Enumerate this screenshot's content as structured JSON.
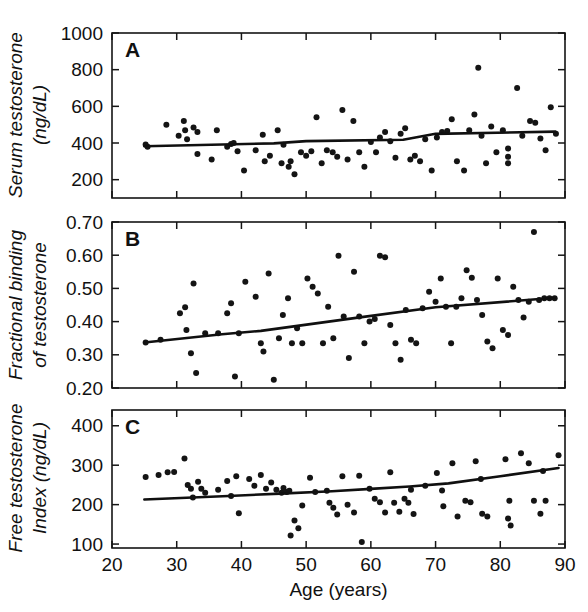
{
  "figure": {
    "background": "#ffffff",
    "ink_color": "#141414",
    "point_color": "#141414",
    "line_color": "#101010"
  },
  "chart_data": [
    {
      "type": "scatter",
      "panel": "A",
      "title": "",
      "xlabel": "Age (years)",
      "ylabel": "Serum testosterone (ng/dL)",
      "ylabel_line1": "Serum testosterone",
      "ylabel_line2": "(ng/dL)",
      "xlim": [
        20,
        90
      ],
      "ylim": [
        100,
        1000
      ],
      "xticks": [
        20,
        30,
        40,
        50,
        60,
        70,
        80,
        90
      ],
      "xticklabels": [
        "20",
        "30",
        "40",
        "50",
        "60",
        "70",
        "80",
        "90"
      ],
      "yticks": [
        200,
        400,
        600,
        800,
        1000
      ],
      "yticklabels": [
        "200",
        "400",
        "600",
        "800",
        "1000"
      ],
      "grid": false,
      "legend": "none",
      "x": [
        25.2,
        25.5,
        28.4,
        30.3,
        31.1,
        31.3,
        31.6,
        32.6,
        33.2,
        33.2,
        35.4,
        36.2,
        37.8,
        38.4,
        38.8,
        39.4,
        40.4,
        42.2,
        43.3,
        43.6,
        44.4,
        45.6,
        46.2,
        46.5,
        47.3,
        47.6,
        48.2,
        49.2,
        50.0,
        50.8,
        51.6,
        52.4,
        53.2,
        54.1,
        54.8,
        55.6,
        56.4,
        57.3,
        58.2,
        59.0,
        60.0,
        60.8,
        61.4,
        62.2,
        63.0,
        63.8,
        64.6,
        65.3,
        66.1,
        66.8,
        67.6,
        68.4,
        69.4,
        70.2,
        71.0,
        71.8,
        72.5,
        73.3,
        74.4,
        75.2,
        76.0,
        76.6,
        77.1,
        77.8,
        78.6,
        79.4,
        80.4,
        81.2,
        81.2,
        81.2,
        82.6,
        83.4,
        84.6,
        85.4,
        86.2,
        87.0,
        87.8,
        88.6
      ],
      "y": [
        392,
        380,
        500,
        440,
        520,
        470,
        420,
        485,
        460,
        340,
        310,
        470,
        380,
        395,
        400,
        355,
        250,
        360,
        445,
        300,
        330,
        470,
        290,
        390,
        270,
        300,
        230,
        350,
        330,
        355,
        540,
        290,
        360,
        350,
        325,
        580,
        310,
        520,
        350,
        270,
        405,
        350,
        430,
        460,
        410,
        320,
        450,
        480,
        310,
        330,
        300,
        420,
        250,
        430,
        460,
        465,
        530,
        300,
        250,
        470,
        555,
        810,
        440,
        290,
        490,
        350,
        470,
        370,
        325,
        290,
        700,
        440,
        520,
        510,
        425,
        360,
        595,
        450
      ],
      "trendline": {
        "x": [
          25,
          45,
          50,
          65,
          70,
          88.5
        ],
        "y": [
          382,
          398,
          410,
          418,
          450,
          462
        ],
        "description": "fitted regression line, slightly increasing"
      }
    },
    {
      "type": "scatter",
      "panel": "B",
      "title": "",
      "xlabel": "Age (years)",
      "ylabel": "Fractional binding of testosterone",
      "ylabel_line1": "Fractional binding",
      "ylabel_line2": "of testosterone",
      "xlim": [
        20,
        90
      ],
      "ylim": [
        0.2,
        0.7
      ],
      "xticks": [
        20,
        30,
        40,
        50,
        60,
        70,
        80,
        90
      ],
      "xticklabels": [
        "20",
        "30",
        "40",
        "50",
        "60",
        "70",
        "80",
        "90"
      ],
      "yticks": [
        0.2,
        0.3,
        0.4,
        0.5,
        0.6,
        0.7
      ],
      "yticklabels": [
        "0.20",
        "0.30",
        "0.40",
        "0.50",
        "0.60",
        "0.70"
      ],
      "grid": false,
      "legend": "none",
      "x": [
        25.2,
        27.5,
        30.5,
        31.3,
        31.5,
        32.2,
        32.6,
        33.0,
        34.4,
        36.4,
        37.8,
        38.4,
        39.0,
        39.6,
        40.6,
        42.2,
        43.0,
        43.4,
        44.2,
        45.0,
        45.8,
        46.4,
        47.2,
        47.8,
        48.6,
        49.4,
        50.2,
        51.0,
        51.8,
        52.6,
        53.4,
        54.2,
        55.0,
        55.8,
        56.6,
        57.4,
        58.2,
        59.0,
        59.8,
        60.6,
        61.4,
        62.2,
        63.0,
        63.8,
        64.6,
        65.4,
        66.2,
        67.0,
        68.0,
        69.0,
        70.0,
        70.8,
        71.6,
        72.4,
        73.2,
        74.0,
        74.8,
        75.6,
        76.4,
        77.2,
        78.0,
        78.8,
        79.6,
        80.4,
        81.2,
        82.0,
        82.8,
        83.6,
        84.4,
        85.2,
        86.0,
        86.8,
        87.6,
        88.4
      ],
      "y": [
        0.337,
        0.345,
        0.425,
        0.443,
        0.375,
        0.305,
        0.515,
        0.245,
        0.365,
        0.365,
        0.425,
        0.455,
        0.235,
        0.365,
        0.52,
        0.475,
        0.335,
        0.31,
        0.545,
        0.225,
        0.35,
        0.42,
        0.47,
        0.335,
        0.38,
        0.335,
        0.53,
        0.505,
        0.485,
        0.335,
        0.445,
        0.35,
        0.598,
        0.415,
        0.29,
        0.55,
        0.415,
        0.335,
        0.4,
        0.408,
        0.598,
        0.594,
        0.39,
        0.335,
        0.285,
        0.435,
        0.345,
        0.335,
        0.44,
        0.49,
        0.46,
        0.53,
        0.445,
        0.335,
        0.445,
        0.47,
        0.555,
        0.532,
        0.465,
        0.42,
        0.34,
        0.32,
        0.53,
        0.375,
        0.36,
        0.505,
        0.465,
        0.412,
        0.46,
        0.67,
        0.465,
        0.47,
        0.47,
        0.47
      ],
      "trendline": {
        "x": [
          25,
          37,
          43,
          58,
          70,
          88.5
        ],
        "y": [
          0.337,
          0.362,
          0.372,
          0.412,
          0.443,
          0.472
        ],
        "description": "fitted regression line, increasing"
      }
    },
    {
      "type": "scatter",
      "panel": "C",
      "title": "",
      "xlabel": "Age (years)",
      "ylabel": "Free testosterone Index (ng/dL)",
      "ylabel_line1": "Free testosterone",
      "ylabel_line2": "Index (ng/dL)",
      "xlim": [
        20,
        90
      ],
      "ylim": [
        90,
        440
      ],
      "xticks": [
        20,
        30,
        40,
        50,
        60,
        70,
        80,
        90
      ],
      "xticklabels": [
        "20",
        "30",
        "40",
        "50",
        "60",
        "70",
        "80",
        "90"
      ],
      "yticks": [
        100,
        200,
        300,
        400
      ],
      "yticklabels": [
        "100",
        "200",
        "300",
        "400"
      ],
      "grid": false,
      "legend": "none",
      "x": [
        25.2,
        27.2,
        28.6,
        29.6,
        31.2,
        31.7,
        32.2,
        32.5,
        33.3,
        33.8,
        34.4,
        36.4,
        37.8,
        38.4,
        39.2,
        39.6,
        41.2,
        42.0,
        43.0,
        43.8,
        44.6,
        45.4,
        46.2,
        46.5,
        47.0,
        47.4,
        47.6,
        48.2,
        48.8,
        49.4,
        50.6,
        51.4,
        53.2,
        53.6,
        54.2,
        54.8,
        55.6,
        56.4,
        57.4,
        58.2,
        58.6,
        59.8,
        60.6,
        61.4,
        62.2,
        63.0,
        63.6,
        64.4,
        65.2,
        65.8,
        66.2,
        66.6,
        68.4,
        70.2,
        71.0,
        71.2,
        72.6,
        73.4,
        74.6,
        75.4,
        76.2,
        77.0,
        77.2,
        78.0,
        80.8,
        81.2,
        81.4,
        81.6,
        83.2,
        84.4,
        85.2,
        86.2,
        86.6,
        87.0,
        89.0
      ],
      "y": [
        270,
        275,
        282,
        283,
        317,
        250,
        240,
        218,
        258,
        240,
        230,
        238,
        260,
        222,
        272,
        178,
        265,
        248,
        275,
        240,
        256,
        238,
        230,
        242,
        232,
        235,
        122,
        160,
        140,
        198,
        268,
        232,
        235,
        205,
        192,
        175,
        272,
        200,
        180,
        273,
        105,
        240,
        215,
        206,
        180,
        282,
        205,
        182,
        215,
        205,
        238,
        176,
        248,
        280,
        236,
        196,
        305,
        170,
        210,
        206,
        310,
        265,
        177,
        170,
        315,
        165,
        210,
        147,
        330,
        305,
        210,
        177,
        285,
        210,
        325
      ],
      "trendline": {
        "x": [
          25,
          38,
          46,
          54,
          60,
          66,
          72,
          80,
          89
        ],
        "y": [
          213,
          222,
          228,
          234,
          240,
          246,
          254,
          272,
          293
        ],
        "description": "fitted regression line, slightly increasing and curving upward at high ages"
      }
    }
  ],
  "axis": {
    "x_title": "Age (years)"
  },
  "panels": {
    "a_letter": "A",
    "b_letter": "B",
    "c_letter": "C"
  }
}
